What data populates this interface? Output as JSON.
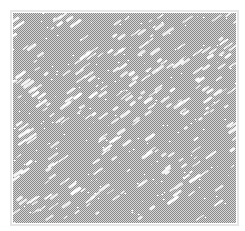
{
  "image": {
    "width": 245,
    "height": 231,
    "background": "#ffffff",
    "texture": {
      "x": 13,
      "y": 13,
      "width": 223,
      "height": 210,
      "dither_dark": "#8a8a8a",
      "dither_light": "#d6d6d6",
      "border_color": "#e6e6e6",
      "streak_color": "#ffffff",
      "streak_angle_deg": -35,
      "streak_count": 260,
      "seed": 7
    }
  }
}
